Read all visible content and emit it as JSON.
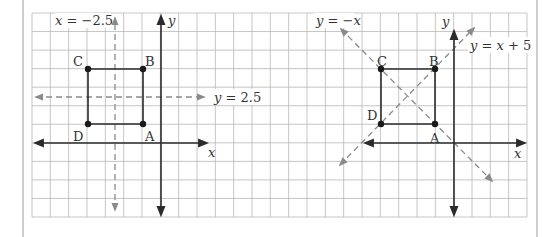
{
  "colors": {
    "grid": "#b8b8b8",
    "axis": "#2b2b2b",
    "dashed": "#8a8a8a",
    "square": "#2b2b2b",
    "frame": "#9a9a9a"
  },
  "left_graph": {
    "axis_labels": {
      "x": "x",
      "y": "y"
    },
    "points": [
      {
        "label": "A",
        "x": -1,
        "y": 1
      },
      {
        "label": "B",
        "x": -1,
        "y": 4
      },
      {
        "label": "C",
        "x": -4,
        "y": 4
      },
      {
        "label": "D",
        "x": -4,
        "y": 1
      }
    ],
    "lines": [
      {
        "equation": "x = −2.5",
        "style": "dashed",
        "orientation": "vertical"
      },
      {
        "equation": "y = 2.5",
        "style": "dashed",
        "orientation": "horizontal"
      }
    ],
    "label_x_eq": "x",
    "label_x_val": " = −2.5",
    "label_y_eq": "y",
    "label_y_val": " = 2.5"
  },
  "right_graph": {
    "axis_labels": {
      "x": "x",
      "y": "y"
    },
    "points": [
      {
        "label": "A",
        "x": -1,
        "y": 1
      },
      {
        "label": "B",
        "x": -1,
        "y": 4
      },
      {
        "label": "C",
        "x": -4,
        "y": 4
      },
      {
        "label": "D",
        "x": -4,
        "y": 1
      }
    ],
    "lines": [
      {
        "equation": "y = −x",
        "style": "dashed",
        "orientation": "diagonal"
      },
      {
        "equation": "y = x + 5",
        "style": "dashed",
        "orientation": "diagonal"
      }
    ],
    "label_negx_y": "y",
    "label_negx_rest": " = −",
    "label_negx_x": "x",
    "label_xp5_y": "y",
    "label_xp5_mid": " = ",
    "label_xp5_x": "x",
    "label_xp5_rest": " + 5"
  }
}
